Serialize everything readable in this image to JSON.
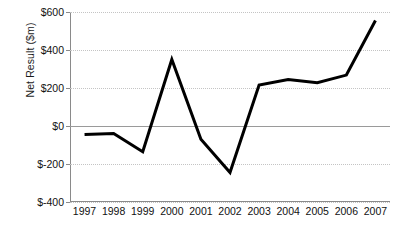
{
  "chart_data": {
    "type": "line",
    "title": "",
    "xlabel": "",
    "ylabel": "Net Result ($m)",
    "categories": [
      "1997",
      "1998",
      "1999",
      "2000",
      "2001",
      "2002",
      "2003",
      "2004",
      "2005",
      "2006",
      "2007"
    ],
    "values": [
      -45,
      -40,
      -135,
      350,
      -70,
      -245,
      215,
      245,
      228,
      268,
      555
    ],
    "series": [
      {
        "name": "Net Result",
        "values": [
          -45,
          -40,
          -135,
          350,
          -70,
          -245,
          215,
          245,
          228,
          268,
          555
        ]
      }
    ],
    "ylim": [
      -400,
      600
    ],
    "ytick_values": [
      600,
      400,
      200,
      0,
      -200,
      -400
    ],
    "ytick_labels": [
      "$600",
      "$400",
      "$200",
      "$0",
      "$-200",
      "$-400"
    ],
    "xtick_labels": [
      "1997",
      "1998",
      "1999",
      "2000",
      "2001",
      "2002",
      "2003",
      "2004",
      "2005",
      "2006",
      "2007"
    ],
    "grid": true,
    "grid_style": "dotted-horizontal",
    "zero_reference_line": true,
    "legend": "none",
    "line_color": "#000000",
    "line_width": 3,
    "grid_color": "#c4c4c4",
    "axis_color": "#8a8a8a",
    "background_color": "#ffffff"
  }
}
